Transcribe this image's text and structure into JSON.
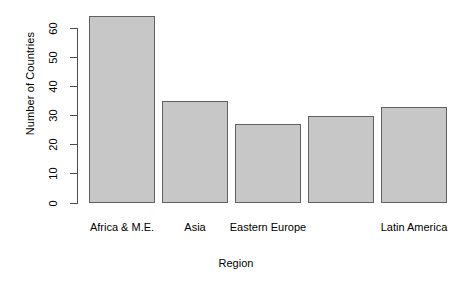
{
  "chart_data": {
    "type": "bar",
    "title": "",
    "xlabel": "Region",
    "ylabel": "Number of Countries",
    "categories": [
      "Africa & M.E.",
      "Asia",
      "Eastern Europe",
      "",
      "Latin America"
    ],
    "visible_tick_labels": [
      "Africa & M.E.",
      "Asia",
      "Eastern Europe",
      "Latin America"
    ],
    "values": [
      64,
      35,
      27,
      30,
      33
    ],
    "ylim": [
      0,
      64
    ],
    "y_ticks": [
      0,
      10,
      20,
      30,
      40,
      50,
      60
    ],
    "y_tick_labels": [
      "0",
      "10",
      "20",
      "30",
      "40",
      "50",
      "60"
    ],
    "grid": false,
    "legend": false,
    "bar_fill_color": "#c7c7c7",
    "bar_border_color": "#616161",
    "axis_color": "#4d4d4d",
    "background_color": "#ffffff"
  }
}
